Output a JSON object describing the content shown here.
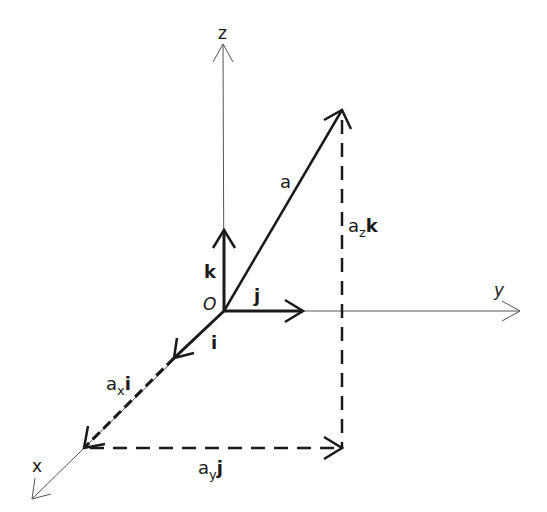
{
  "diagram": {
    "origin_label": "O",
    "axes": {
      "x": "x",
      "y": "y",
      "z": "z"
    },
    "unit_vectors": {
      "i": "i",
      "j": "j",
      "k": "k"
    },
    "vector": {
      "label": "a"
    },
    "components": {
      "ax_base": "a",
      "ax_sub": "x",
      "ax_unit": "i",
      "ay_base": "a",
      "ay_sub": "y",
      "ay_unit": "j",
      "az_base": "a",
      "az_sub": "z",
      "az_unit": "k"
    },
    "colors": {
      "stroke": "#1a1a1a",
      "axis": "#555555",
      "background": "#ffffff"
    }
  }
}
